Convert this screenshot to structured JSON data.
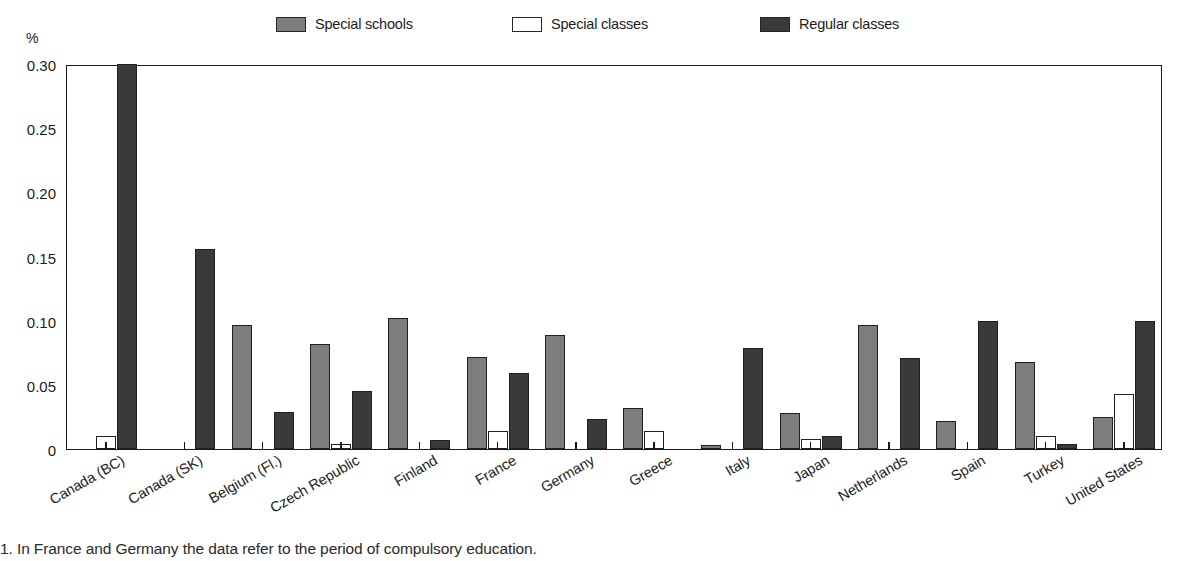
{
  "axis": {
    "unit_label": "%",
    "y_ticks": [
      "0.30",
      "0.25",
      "0.20",
      "0.15",
      "0.10",
      "0.05",
      "0"
    ]
  },
  "legend": {
    "items": [
      {
        "label": "Special schools",
        "key": "special_schools",
        "color": "#7d7d7d"
      },
      {
        "label": "Special classes",
        "key": "special_classes",
        "color": "#ffffff"
      },
      {
        "label": "Regular classes",
        "key": "regular_classes",
        "color": "#3a3a3a"
      }
    ]
  },
  "footnote": "1. In France and Germany the data refer to the period of compulsory education.",
  "chart_data": {
    "type": "bar",
    "title": "",
    "xlabel": "",
    "ylabel": "%",
    "ylim": [
      0,
      0.3
    ],
    "ytick_values": [
      0.3,
      0.25,
      0.2,
      0.15,
      0.1,
      0.05,
      0
    ],
    "grid": false,
    "legend_position": "top",
    "categories": [
      "Canada (BC)",
      "Canada (SK)",
      "Belgium (Fl.)",
      "Czech Republic",
      "Finland",
      "France",
      "Germany",
      "Greece",
      "Italy",
      "Japan",
      "Netherlands",
      "Spain",
      "Turkey",
      "United States"
    ],
    "series": [
      {
        "name": "Special schools",
        "color": "#7d7d7d",
        "values": [
          0.0,
          0.0,
          0.097,
          0.082,
          0.102,
          0.072,
          0.089,
          0.032,
          0.003,
          0.028,
          0.097,
          0.022,
          0.068,
          0.025
        ]
      },
      {
        "name": "Special classes",
        "color": "#ffffff",
        "values": [
          0.01,
          0.0,
          0.0,
          0.004,
          0.0,
          0.014,
          0.0,
          0.014,
          0.0,
          0.008,
          0.0,
          0.0,
          0.01,
          0.043
        ]
      },
      {
        "name": "Regular classes",
        "color": "#3a3a3a",
        "values": [
          0.3,
          0.156,
          0.029,
          0.045,
          0.007,
          0.059,
          0.023,
          0.0,
          0.079,
          0.01,
          0.071,
          0.1,
          0.004,
          0.1
        ]
      }
    ]
  }
}
